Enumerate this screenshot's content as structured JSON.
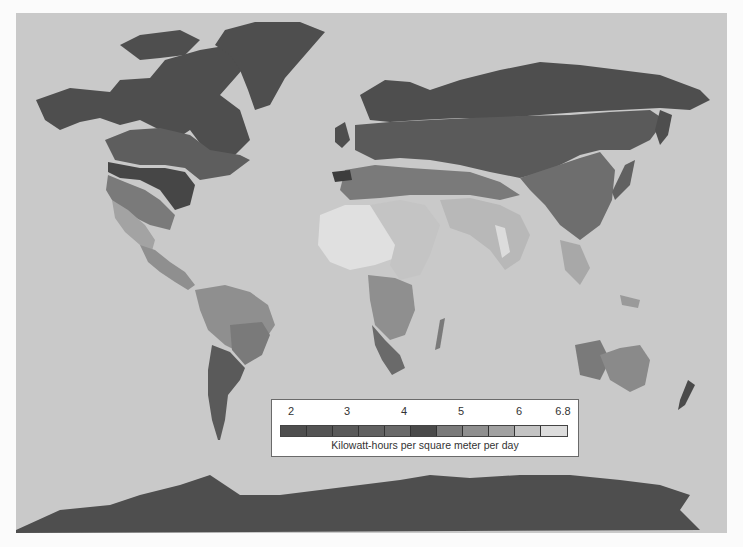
{
  "map": {
    "title": "World solar insolation map",
    "ocean_color": "#c9c9c9"
  },
  "legend": {
    "ticks": [
      {
        "label": "2",
        "x": 19
      },
      {
        "label": "3",
        "x": 75
      },
      {
        "label": "4",
        "x": 132
      },
      {
        "label": "5",
        "x": 189
      },
      {
        "label": "6",
        "x": 247
      },
      {
        "label": "6.8",
        "x": 291
      }
    ],
    "caption": "Kilowatt-hours per square meter per day",
    "colors": [
      "#4e4e4e",
      "#545454",
      "#5a5a5a",
      "#616161",
      "#696969",
      "#4a4a4a",
      "#7a7a7a",
      "#8f8f8f",
      "#a1a1a1",
      "#c3c3c3",
      "#dddddd"
    ]
  },
  "chart_data": {
    "type": "heatmap",
    "title": "",
    "legend_title": "Kilowatt-hours per square meter per day",
    "scale_ticks": [
      2,
      3,
      4,
      5,
      6,
      6.8
    ],
    "scale_bins": 11,
    "regions": [
      {
        "name": "Greenland / Canada Arctic / Alaska",
        "level": "≈2"
      },
      {
        "name": "Northern Russia / Scandinavia",
        "level": "≈2"
      },
      {
        "name": "Antarctica",
        "level": "≈2"
      },
      {
        "name": "Southern Canada / central Russia",
        "level": "≈2.5-3"
      },
      {
        "name": "Northeast USA",
        "level": "≈3.5-4"
      },
      {
        "name": "Southwest USA",
        "level": "≈5-6"
      },
      {
        "name": "Sahara",
        "level": "≈6.8"
      },
      {
        "name": "Arabian Peninsula / India",
        "level": "≈5.5-6.5"
      },
      {
        "name": "Australia",
        "level": "≈5"
      },
      {
        "name": "Southern South America",
        "level": "≈3.5-4"
      },
      {
        "name": "New Zealand",
        "level": "≈3"
      }
    ]
  }
}
